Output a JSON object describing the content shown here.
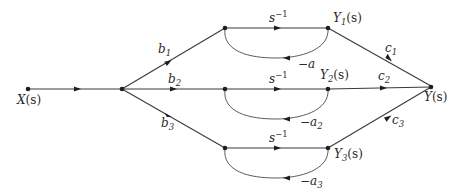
{
  "diagram": {
    "nodes": {
      "input": {
        "label": "X(s)",
        "var": "X",
        "arg": "(s)"
      },
      "y1": {
        "label": "Y1(s)",
        "var": "Y",
        "sub": "1",
        "arg": "(s)"
      },
      "y2": {
        "label": "Y2(s)",
        "var": "Y",
        "sub": "2",
        "arg": "(s)"
      },
      "y3": {
        "label": "Y3(s)",
        "var": "Y",
        "sub": "3",
        "arg": "(s)"
      },
      "output": {
        "label": "Y(s)",
        "var": "Y",
        "arg": "(s)"
      }
    },
    "branches": [
      {
        "input_gain": {
          "var": "b",
          "sub": "1"
        },
        "forward": {
          "var": "s",
          "sup": "−1"
        },
        "feedback": {
          "text": "−a"
        },
        "output_gain": {
          "var": "c",
          "sub": "1"
        }
      },
      {
        "input_gain": {
          "var": "b",
          "sub": "2"
        },
        "forward": {
          "var": "s",
          "sup": "−1"
        },
        "feedback": {
          "text": "−a",
          "sub": "2"
        },
        "output_gain": {
          "var": "c",
          "sub": "2"
        }
      },
      {
        "input_gain": {
          "var": "b",
          "sub": "3"
        },
        "forward": {
          "var": "s",
          "sup": "−1"
        },
        "feedback": {
          "text": "−a",
          "sub": "3"
        },
        "output_gain": {
          "var": "c",
          "sub": "3"
        }
      }
    ]
  }
}
